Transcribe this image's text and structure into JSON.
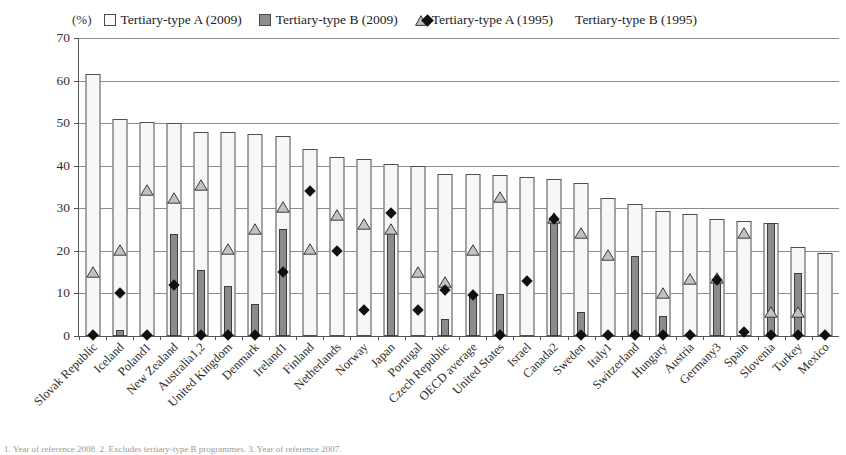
{
  "unit_label": "(%)",
  "legend": [
    {
      "name": "tertiary-a-2009",
      "marker": "white-square",
      "label": "Tertiary-type A (2009)"
    },
    {
      "name": "tertiary-b-2009",
      "marker": "gray-square",
      "label": "Tertiary-type B (2009)"
    },
    {
      "name": "tertiary-a-1995",
      "marker": "triangle",
      "label": "Tertiary-type A (1995)"
    },
    {
      "name": "tertiary-b-1995",
      "marker": "diamond",
      "label": "Tertiary-type B (1995)"
    }
  ],
  "yaxis": {
    "ticks": [
      "0",
      "10",
      "20",
      "30",
      "40",
      "50",
      "60",
      "70"
    ],
    "min": 0,
    "max": 70,
    "step": 10
  },
  "footnote": "1. Year of reference 2008.  2. Excludes tertiary-type B programmes.  3. Year of reference 2007.",
  "chart_data": {
    "type": "bar",
    "title": "",
    "subtitle": "",
    "xlabel": "",
    "ylabel": "(%)",
    "ylim": [
      0,
      70
    ],
    "grid": true,
    "legend_position": "top",
    "categories": [
      "Slovak Republic",
      "Iceland",
      "Poland1",
      "New Zealand",
      "Australia1,2",
      "United Kingdom",
      "Denmark",
      "Ireland1",
      "Finland",
      "Netherlands",
      "Norway",
      "Japan",
      "Portugal",
      "Czech Republic",
      "OECD average",
      "United States",
      "Israel",
      "Canada2",
      "Sweden",
      "Italy1",
      "Switzerland",
      "Hungary",
      "Austria",
      "Germany3",
      "Spain",
      "Slovenia",
      "Turkey",
      "Mexico"
    ],
    "series": [
      {
        "name": "Tertiary-type A (2009)",
        "marker": "white-square",
        "values": [
          61.5,
          51.0,
          50.2,
          50.0,
          48.0,
          48.0,
          47.5,
          47.0,
          44.0,
          42.0,
          41.5,
          40.5,
          40.0,
          38.0,
          38.0,
          37.8,
          37.3,
          36.8,
          36.0,
          32.5,
          31.0,
          29.3,
          28.7,
          27.5,
          27.0,
          26.6,
          21.0,
          19.5
        ]
      },
      {
        "name": "Tertiary-type B (2009)",
        "marker": "gray-square",
        "values": [
          0.0,
          1.3,
          0.0,
          24.0,
          15.6,
          11.7,
          7.6,
          25.2,
          0.0,
          0.0,
          0.0,
          25.0,
          0.0,
          4.0,
          10.0,
          9.8,
          0.0,
          27.0,
          5.7,
          0.0,
          18.8,
          4.6,
          0.0,
          13.1,
          0.0,
          26.6,
          14.8,
          0.8
        ]
      },
      {
        "name": "Tertiary-type A (1995)",
        "marker": "triangle",
        "values": [
          14.7,
          20.0,
          34.1,
          32.3,
          35.3,
          20.2,
          25.0,
          30.1,
          20.1,
          28.1,
          26.0,
          25.0,
          14.8,
          12.4,
          20.0,
          32.5,
          null,
          27.4,
          24.0,
          18.9,
          null,
          9.8,
          13.1,
          13.3,
          24.0,
          5.5,
          5.5,
          null
        ]
      },
      {
        "name": "Tertiary-type B (1995)",
        "marker": "diamond",
        "values": [
          0.2,
          10.0,
          0.2,
          12.0,
          0.2,
          0.2,
          0.2,
          15.0,
          34.0,
          20.0,
          6.2,
          28.9,
          6.1,
          10.9,
          9.6,
          0.2,
          12.9,
          27.4,
          0.2,
          0.2,
          0.2,
          0.2,
          0.2,
          13.2,
          1.0,
          0.2,
          0.2,
          0.2
        ]
      }
    ]
  }
}
